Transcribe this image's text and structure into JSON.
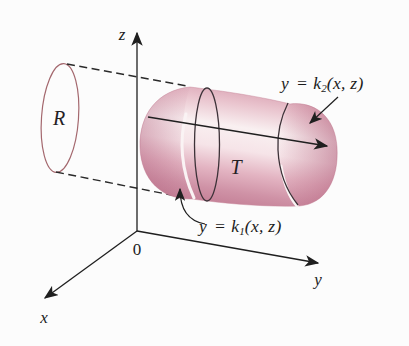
{
  "figure": {
    "title_hint": "solid region T between surfaces with projection R onto xz-plane",
    "axes": {
      "z": "z",
      "x": "x",
      "y": "y",
      "origin": "0"
    },
    "labels": {
      "region": "R",
      "solid": "T",
      "upper_surface": {
        "lhs": "y",
        "eq": "=",
        "fname": "k",
        "sub": "2",
        "args": "(x, z)"
      },
      "lower_surface": {
        "lhs": "y",
        "eq": "=",
        "fname": "k",
        "sub": "1",
        "args": "(x, z)"
      }
    },
    "colors": {
      "solid_highlight": "#f9f0f1",
      "solid_mid": "#e3b4c2",
      "solid_dark": "#c27d94",
      "curve_outline": "#3d3238",
      "region_outline": "#a4686e",
      "axis": "#1f1f1f"
    }
  }
}
